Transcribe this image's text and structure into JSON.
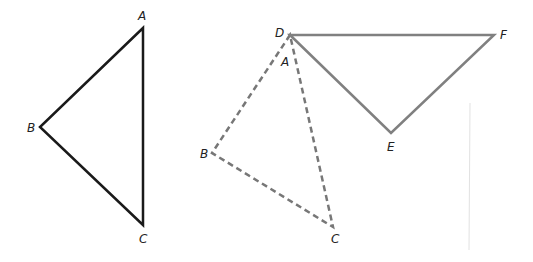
{
  "colors": {
    "original": "#1a1a1a",
    "image_triangle": "#808080",
    "dashed": "#777777",
    "divider": "#dddddd"
  },
  "triangle_abc": {
    "vertices": {
      "A": {
        "label": "A",
        "x": 143,
        "y": 28
      },
      "B": {
        "label": "B",
        "x": 40,
        "y": 127
      },
      "C": {
        "label": "C",
        "x": 143,
        "y": 225
      }
    }
  },
  "triangle_def": {
    "vertices": {
      "D": {
        "label": "D",
        "x": 290,
        "y": 35
      },
      "E": {
        "label": "E",
        "x": 391,
        "y": 133
      },
      "F": {
        "label": "F",
        "x": 494,
        "y": 35
      }
    }
  },
  "triangle_abc_rotated": {
    "vertices": {
      "A": {
        "label": "A",
        "x": 290,
        "y": 35
      },
      "B": {
        "label": "B",
        "x": 212,
        "y": 153
      },
      "C": {
        "label": "C",
        "x": 333,
        "y": 227
      }
    }
  }
}
